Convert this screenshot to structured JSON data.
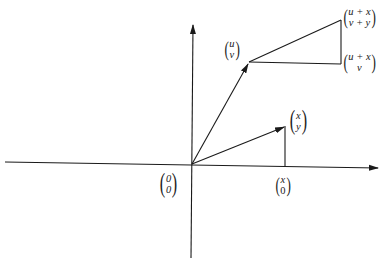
{
  "figure": {
    "colors": {
      "line": "#1a1a1a",
      "background": "#ffffff"
    }
  },
  "labels": {
    "origin": {
      "top": "0",
      "bottom": "0"
    },
    "uv": {
      "top": "u",
      "bottom": "v"
    },
    "xy": {
      "top": "x",
      "bottom": "y"
    },
    "x0": {
      "top": "x",
      "bottom": "0"
    },
    "sum": {
      "top": "u + x",
      "bottom": "v + y"
    },
    "corner": {
      "top": "u + x",
      "bottom": "v"
    }
  },
  "geometry": {
    "origin": [
      192,
      165
    ],
    "uv_point": [
      249,
      62
    ],
    "xy_point": [
      285,
      126
    ],
    "x0_point": [
      285,
      167
    ],
    "sum_point": [
      341,
      20
    ],
    "corner_point": [
      341,
      64
    ]
  }
}
